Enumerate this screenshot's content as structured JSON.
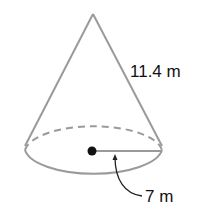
{
  "figure": {
    "shape": "cone",
    "slant_height_label": "11.4 m",
    "radius_label": "7 m",
    "colors": {
      "outline": "#9a9a9a",
      "center_dot": "#111111",
      "text": "#111111",
      "arrow": "#222222"
    }
  }
}
